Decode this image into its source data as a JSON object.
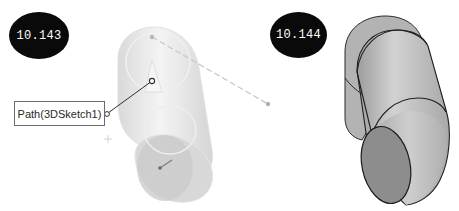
{
  "figures": [
    {
      "id": "left",
      "badge_label": "10.143",
      "description": "Translucent sweep preview along 3D sketch path",
      "callout_label": "Path(3DSketch1)"
    },
    {
      "id": "right",
      "badge_label": "10.144",
      "description": "Resulting shaded swept solid (elbow cylinder)"
    }
  ],
  "colors": {
    "badge_bg": "#0a0a0a",
    "badge_text": "#ffffff",
    "preview_fill": "#e4e4e4",
    "solid_fill": "#bdbdbd",
    "solid_edge": "#1e1e1e",
    "end_face": "#8a8a8a"
  }
}
